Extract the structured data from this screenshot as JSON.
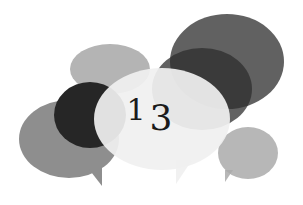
{
  "figure": {
    "type": "decorative-chapter-marker",
    "chapter_number": "13",
    "digits": [
      "1",
      "3"
    ],
    "colors": {
      "background": "#ffffff",
      "number": "#1a1a1a",
      "bubble_left_mid_gray": "#8e8e8e",
      "bubble_top_light_gray": "#b4b4b4",
      "bubble_black": "#2a2a2a",
      "bubble_top_right_dark": "#5e5e5e",
      "bubble_center_white": "#ececec",
      "bubble_right_small": "#b8b8b8"
    }
  }
}
